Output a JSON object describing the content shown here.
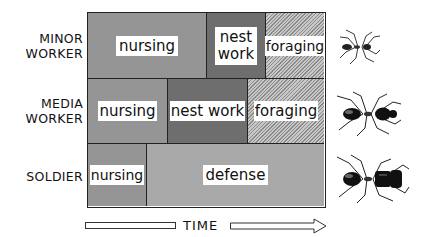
{
  "rows": [
    {
      "label_line1": "MINOR",
      "label_line2": "WORKER",
      "tasks": [
        {
          "name": "nursing",
          "label": "nursing"
        },
        {
          "name": "nest-work",
          "label_line1": "nest",
          "label_line2": "work"
        },
        {
          "name": "foraging",
          "label": "foraging"
        }
      ]
    },
    {
      "label_line1": "MEDIA",
      "label_line2": "WORKER",
      "tasks": [
        {
          "name": "nursing",
          "label": "nursing"
        },
        {
          "name": "nest-work",
          "label": "nest work"
        },
        {
          "name": "foraging",
          "label": "foraging"
        }
      ]
    },
    {
      "label_line1": "SOLDIER",
      "tasks": [
        {
          "name": "nursing",
          "label": "nursing"
        },
        {
          "name": "defense",
          "label": "defense"
        }
      ]
    }
  ],
  "axis": {
    "label": "TIME"
  },
  "icons": [
    "ant-small-icon",
    "ant-medium-icon",
    "ant-large-icon"
  ]
}
